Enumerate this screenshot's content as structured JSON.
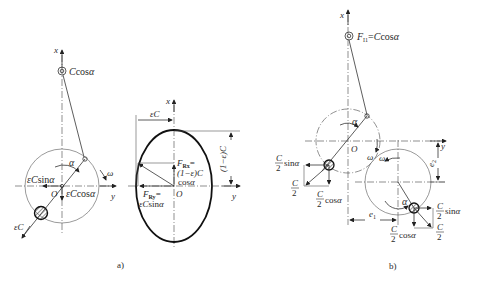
{
  "figure": {
    "panel_a": {
      "caption": "a)",
      "left": {
        "axis_x": "x",
        "axis_y": "y",
        "origin": "O",
        "top_weight_label": "Ccosα",
        "angle": "α",
        "omega": "ω",
        "horiz_force": "εCsinα",
        "vert_force": "εCcosα",
        "resultant": "εC"
      },
      "ellipse": {
        "axis_x": "x",
        "axis_y": "y",
        "origin": "O",
        "width_dim": "εC",
        "height_dim": "(1−ε)C",
        "frx_line1": "F",
        "frx_sub": "Rx",
        "frx_eq": "=",
        "frx_line2": "(1−ε)C",
        "frx_line3": "cosα",
        "fry_line1": "F",
        "fry_sub": "Ry",
        "fry_eq": "=",
        "fry_line2": "εCsinα"
      }
    },
    "panel_b": {
      "caption": "b)",
      "axis_x": "x",
      "axis_y": "y",
      "origin": "O",
      "top_label_F": "F",
      "top_label_sub": "I1",
      "top_label_rest": "=Ccosα",
      "angle_upper": "α",
      "angle_lower": "α",
      "omega_upper": "ω",
      "omega_lower": "ω",
      "e1": "e",
      "e1_sub": "1",
      "e2": "e",
      "e2_sub": "2",
      "upper_sin_num": "C",
      "upper_sin_den": "2",
      "upper_sin_rest": "sinα",
      "upper_cos_num": "C",
      "upper_cos_den": "2",
      "upper_cos_rest": "cosα",
      "upper_res_num": "C",
      "upper_res_den": "2",
      "lower_sin_num": "C",
      "lower_sin_den": "2",
      "lower_sin_rest": "sinα",
      "lower_cos_num": "C",
      "lower_cos_den": "2",
      "lower_cos_rest": "cosα",
      "lower_res_num": "C",
      "lower_res_den": "2"
    }
  }
}
